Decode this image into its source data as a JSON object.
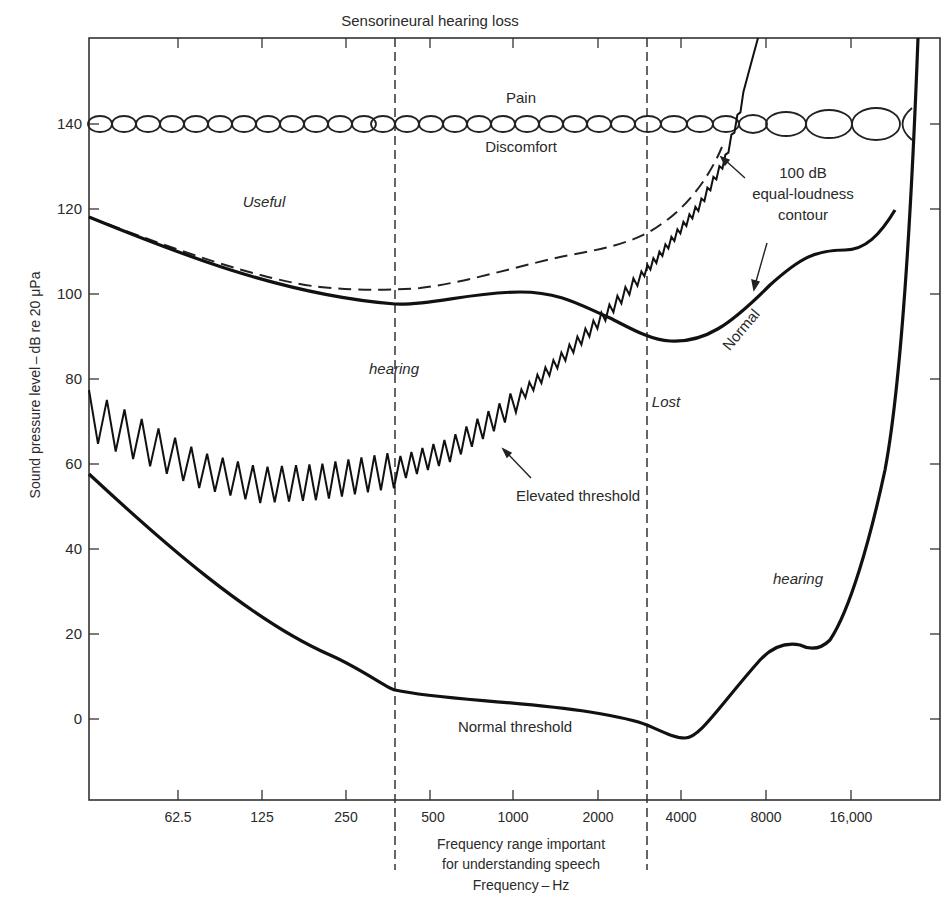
{
  "chart_data": {
    "type": "line",
    "title": "Sensorineural hearing loss",
    "xlabel": "Frequency — Hz",
    "xlabel_text": "Frequency – Hz",
    "ylabel": "Sound pressure level – dB re 20 μPa",
    "x_scale": "log2 (octaves)",
    "x_ticks": [
      "62.5",
      "125",
      "250",
      "500",
      "1000",
      "2000",
      "4000",
      "8000",
      "16,000"
    ],
    "y_ticks": [
      0,
      20,
      40,
      60,
      80,
      100,
      120,
      140
    ],
    "ylim": [
      -20,
      160
    ],
    "grid": false,
    "speech_range": {
      "label_lines": [
        "Frequency range important",
        "for understanding speech"
      ],
      "from_hz": 350,
      "to_hz": 2800
    },
    "series": [
      {
        "name": "Normal threshold",
        "style": "solid",
        "x_hz": [
          31,
          62.5,
          125,
          250,
          350,
          500,
          1000,
          2000,
          2800,
          4000,
          5000,
          8000,
          10000,
          12000,
          16000,
          20000,
          22000
        ],
        "values": [
          57,
          41,
          24,
          11,
          7,
          5,
          4,
          2,
          -1,
          -5,
          0,
          14,
          14,
          18,
          55,
          120,
          160
        ]
      },
      {
        "name": "Elevated threshold",
        "style": "zigzag",
        "x_hz": [
          31,
          62.5,
          125,
          250,
          350,
          500,
          1000,
          2000,
          2800,
          4000,
          5000,
          6000
        ],
        "values": [
          70,
          58,
          46,
          44,
          48,
          52,
          66,
          90,
          104,
          122,
          140,
          160
        ]
      },
      {
        "name": "Normal (100 dB equal-loudness contour)",
        "style": "solid",
        "x_hz": [
          31,
          62.5,
          125,
          250,
          350,
          500,
          1000,
          2000,
          2800,
          4000,
          5600,
          8000,
          11000,
          16000,
          20000
        ],
        "values": [
          118,
          111,
          104,
          99,
          97,
          98,
          100,
          97,
          91,
          89,
          93,
          106,
          110,
          112,
          120
        ]
      },
      {
        "name": "100 dB equal-loudness contour (lost hearing)",
        "style": "dashed",
        "x_hz": [
          31,
          62.5,
          125,
          250,
          350,
          500,
          1000,
          2000,
          2800,
          4000,
          5000
        ],
        "values": [
          118,
          110,
          105,
          101,
          101,
          102,
          106,
          110,
          114,
          124,
          134
        ]
      },
      {
        "name": "Pain / Discomfort",
        "style": "chain-of-ellipses",
        "x_hz": [
          31,
          22000
        ],
        "values": [
          140,
          140
        ]
      }
    ],
    "annotations": [
      {
        "text": "Pain",
        "x_hz": 1000,
        "y": 146
      },
      {
        "text": "Discomfort",
        "x_hz": 1000,
        "y": 133
      },
      {
        "text": "Useful",
        "x_hz": 125,
        "y": 122,
        "italic": true
      },
      {
        "text": "hearing",
        "x_hz": 350,
        "y": 80,
        "italic": true
      },
      {
        "text": "Lost",
        "x_hz": 3300,
        "y": 74,
        "italic": true
      },
      {
        "text": "hearing",
        "x_hz": 11000,
        "y": 29,
        "italic": true
      },
      {
        "text": "Elevated threshold",
        "x_hz": 1400,
        "y": 52
      },
      {
        "text": "Normal threshold",
        "x_hz": 1000,
        "y": -2
      },
      {
        "text": "Normal",
        "x_hz": 6200,
        "y": 95,
        "rotated": true
      },
      {
        "text": "100 dB equal-loudness contour",
        "x_hz": 10000,
        "y": 122
      }
    ]
  },
  "labels": {
    "title": "Sensorineural hearing loss",
    "ylabel": "Sound pressure level – dB re 20 μPa",
    "xlabel": "Frequency – Hz",
    "speech_line1": "Frequency range important",
    "speech_line2": "for understanding speech",
    "pain": "Pain",
    "discomfort": "Discomfort",
    "useful": "Useful",
    "hearing_left": "hearing",
    "lost": "Lost",
    "hearing_right": "hearing",
    "elevated": "Elevated threshold",
    "normal_threshold": "Normal threshold",
    "normal_rot": "Normal",
    "contour_1": "100 dB",
    "contour_2": "equal-loudness",
    "contour_3": "contour"
  },
  "ticks": {
    "y": [
      "140",
      "120",
      "100",
      "80",
      "60",
      "40",
      "20",
      "0"
    ],
    "x": [
      "62.5",
      "125",
      "250",
      "500",
      "1000",
      "2000",
      "4000",
      "8000",
      "16,000"
    ]
  }
}
